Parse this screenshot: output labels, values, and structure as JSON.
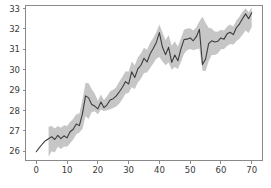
{
  "chart_data": {
    "type": "line",
    "title": "",
    "subtitle": "",
    "xlabel": "",
    "ylabel": "",
    "grid": false,
    "legend": null,
    "xlim": [
      -3.5,
      73.5
    ],
    "ylim": [
      25.55,
      33.15
    ],
    "xticks": [
      0,
      10,
      20,
      30,
      40,
      50,
      60,
      70
    ],
    "yticks": [
      26,
      27,
      28,
      29,
      30,
      31,
      32,
      33
    ],
    "xtick_labels": [
      "0",
      "10",
      "20",
      "30",
      "40",
      "50",
      "60",
      "70"
    ],
    "ytick_labels": [
      "26",
      "27",
      "28",
      "29",
      "30",
      "31",
      "32",
      "33"
    ],
    "colors": {
      "line": "#3c3c3c",
      "band": "#c6c6c6",
      "band_opacity": 1.0,
      "spine": "#8a8a8a",
      "tick_text": "#3a3a3a",
      "background": "#ffffff"
    },
    "band_start_x": 4,
    "series": [
      {
        "name": "value",
        "x": [
          0,
          1,
          2,
          3,
          4,
          5,
          6,
          7,
          8,
          9,
          10,
          11,
          12,
          13,
          14,
          15,
          16,
          17,
          18,
          19,
          20,
          21,
          22,
          23,
          24,
          25,
          26,
          27,
          28,
          29,
          30,
          31,
          32,
          33,
          34,
          35,
          36,
          37,
          38,
          39,
          40,
          41,
          42,
          43,
          44,
          45,
          46,
          47,
          48,
          49,
          50,
          51,
          52,
          53,
          54,
          55,
          56,
          57,
          58,
          59,
          60,
          61,
          62,
          63,
          64,
          65,
          66,
          67,
          68,
          69,
          70
        ],
        "values": [
          25.98,
          26.18,
          26.36,
          26.52,
          26.62,
          26.72,
          26.58,
          26.78,
          26.62,
          26.76,
          26.66,
          26.96,
          27.08,
          27.34,
          27.26,
          27.84,
          28.72,
          28.62,
          28.3,
          28.22,
          28.08,
          28.42,
          28.14,
          28.28,
          28.52,
          28.58,
          28.72,
          28.92,
          29.14,
          29.42,
          29.3,
          29.9,
          29.62,
          30.04,
          30.22,
          30.56,
          30.38,
          30.78,
          31.04,
          31.34,
          31.82,
          31.1,
          30.74,
          31.1,
          30.36,
          30.72,
          30.44,
          31.02,
          31.48,
          31.5,
          31.56,
          31.42,
          31.62,
          31.98,
          30.26,
          30.52,
          31.28,
          31.42,
          31.36,
          31.4,
          31.56,
          31.5,
          31.76,
          31.84,
          31.72,
          32.06,
          32.24,
          32.5,
          32.74,
          32.5,
          32.8
        ],
        "band_lower": [
          25.98,
          26.18,
          26.36,
          26.52,
          25.74,
          26.0,
          25.94,
          26.22,
          26.12,
          26.24,
          26.22,
          26.4,
          26.58,
          26.84,
          26.92,
          27.1,
          27.72,
          27.58,
          27.92,
          27.96,
          27.82,
          28.04,
          27.98,
          28.02,
          28.06,
          28.12,
          28.2,
          28.34,
          28.56,
          28.82,
          28.86,
          29.14,
          29.06,
          29.38,
          29.56,
          29.84,
          29.86,
          30.08,
          30.3,
          30.54,
          30.62,
          30.4,
          30.22,
          30.36,
          30.0,
          30.14,
          30.04,
          30.38,
          30.78,
          30.96,
          31.02,
          30.96,
          31.0,
          31.04,
          29.96,
          29.92,
          30.42,
          30.72,
          30.72,
          30.8,
          31.0,
          31.02,
          31.16,
          31.26,
          31.22,
          31.4,
          31.52,
          31.72,
          31.92,
          31.8,
          32.1
        ],
        "band_upper": [
          25.98,
          26.18,
          26.36,
          26.52,
          27.2,
          27.24,
          27.12,
          27.24,
          27.16,
          27.28,
          27.24,
          27.44,
          27.6,
          27.82,
          27.86,
          28.52,
          29.36,
          29.34,
          29.06,
          28.84,
          28.48,
          28.78,
          28.52,
          28.7,
          28.94,
          29.02,
          29.16,
          29.42,
          29.66,
          29.92,
          29.9,
          30.4,
          30.22,
          30.6,
          30.8,
          31.08,
          30.98,
          31.32,
          31.56,
          31.84,
          32.22,
          31.82,
          31.46,
          31.7,
          31.18,
          31.4,
          31.14,
          31.54,
          31.96,
          32.02,
          32.04,
          31.92,
          32.08,
          32.38,
          32.6,
          32.3,
          32.06,
          32.02,
          31.88,
          31.86,
          31.96,
          31.92,
          32.12,
          32.22,
          32.12,
          32.42,
          32.6,
          32.84,
          33.02,
          32.82,
          33.06
        ]
      }
    ]
  }
}
